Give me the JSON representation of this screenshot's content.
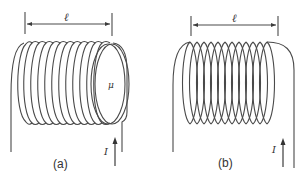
{
  "diagrams": [
    {
      "id": "a",
      "caption": "(a)",
      "length_label": "ℓ",
      "current_label": "I",
      "core_label": "μ",
      "description": "Solenoid wound on a magnetic core of permeability μ, length ℓ, carrying current I"
    },
    {
      "id": "b",
      "caption": "(b)",
      "length_label": "ℓ",
      "current_label": "I",
      "description": "Air-core solenoid (helical coil) of length ℓ carrying current I"
    }
  ],
  "colors": {
    "line": "#4a4a4a",
    "text": "#333333",
    "background": "#ffffff"
  }
}
